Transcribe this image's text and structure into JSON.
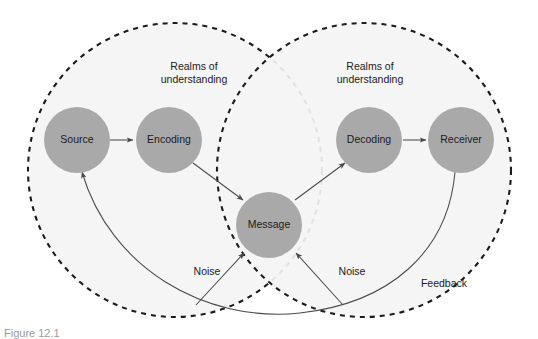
{
  "figure": {
    "caption": "Figure 12.1",
    "background_color": "#ffffff",
    "realm_fill_color": "#f4f4f4",
    "realm_stroke_color": "#1b1b1b",
    "node_fill_color": "#a9a9a9",
    "connector_color": "#4a4a4a",
    "text_color": "#1b1b1b"
  },
  "realms": [
    {
      "id": "realm-left",
      "label_line1": "Realms of",
      "label_line2": "understanding"
    },
    {
      "id": "realm-right",
      "label_line1": "Realms of",
      "label_line2": "understanding"
    }
  ],
  "nodes": [
    {
      "id": "source",
      "label": "Source"
    },
    {
      "id": "encoding",
      "label": "Encoding"
    },
    {
      "id": "message",
      "label": "Message"
    },
    {
      "id": "decoding",
      "label": "Decoding"
    },
    {
      "id": "receiver",
      "label": "Receiver"
    }
  ],
  "connectors": [
    {
      "id": "source-to-encoding",
      "from": "Source",
      "to": "Encoding",
      "label": ""
    },
    {
      "id": "encoding-to-message",
      "from": "Encoding",
      "to": "Message",
      "label": ""
    },
    {
      "id": "message-to-decoding",
      "from": "Message",
      "to": "Decoding",
      "label": ""
    },
    {
      "id": "decoding-to-receiver",
      "from": "Decoding",
      "to": "Receiver",
      "label": ""
    },
    {
      "id": "noise-left",
      "from": "",
      "to": "",
      "label": "Noise"
    },
    {
      "id": "noise-right",
      "from": "",
      "to": "",
      "label": "Noise"
    },
    {
      "id": "feedback",
      "from": "Receiver",
      "to": "Source",
      "label": "Feedback"
    }
  ],
  "labels": {
    "noise_left": "Noise",
    "noise_right": "Noise",
    "feedback": "Feedback"
  }
}
